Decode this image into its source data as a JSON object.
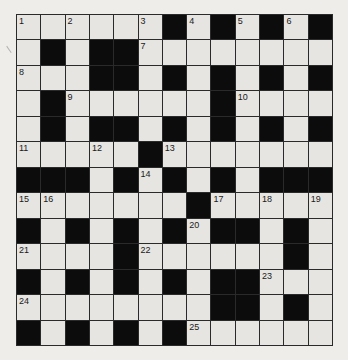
{
  "puzzle": {
    "rows": 13,
    "cols": 13,
    "layout": [
      "WWWWWWBWBWBWB",
      "WBWBBWWWWWWWW",
      "WWWBBWBWBWBWB",
      "WBWWWWWWBWWWW",
      "WBWBBWBWBWBWB",
      "WWWWWBWWWWWWW",
      "BBBWBWBWBWBBB",
      "WWWWWWWBWWWWW",
      "BWBWBWBWBBWBW",
      "WWWWBWWWWWWBW",
      "BWBWBWBWBBWWW",
      "WWWWWWWWBBWBW",
      "BWBWBWBWWWWWW"
    ],
    "numbers": [
      {
        "n": "1",
        "r": 0,
        "c": 0
      },
      {
        "n": "2",
        "r": 0,
        "c": 2
      },
      {
        "n": "3",
        "r": 0,
        "c": 5
      },
      {
        "n": "4",
        "r": 0,
        "c": 7
      },
      {
        "n": "5",
        "r": 0,
        "c": 9
      },
      {
        "n": "6",
        "r": 0,
        "c": 11
      },
      {
        "n": "7",
        "r": 1,
        "c": 5
      },
      {
        "n": "8",
        "r": 2,
        "c": 0
      },
      {
        "n": "9",
        "r": 3,
        "c": 2
      },
      {
        "n": "10",
        "r": 3,
        "c": 9
      },
      {
        "n": "11",
        "r": 5,
        "c": 0
      },
      {
        "n": "12",
        "r": 5,
        "c": 3
      },
      {
        "n": "13",
        "r": 5,
        "c": 6
      },
      {
        "n": "14",
        "r": 6,
        "c": 5
      },
      {
        "n": "15",
        "r": 7,
        "c": 0
      },
      {
        "n": "16",
        "r": 7,
        "c": 1
      },
      {
        "n": "17",
        "r": 7,
        "c": 8
      },
      {
        "n": "18",
        "r": 7,
        "c": 10
      },
      {
        "n": "19",
        "r": 7,
        "c": 12
      },
      {
        "n": "20",
        "r": 8,
        "c": 7
      },
      {
        "n": "21",
        "r": 9,
        "c": 0
      },
      {
        "n": "22",
        "r": 9,
        "c": 5
      },
      {
        "n": "23",
        "r": 10,
        "c": 10
      },
      {
        "n": "24",
        "r": 11,
        "c": 0
      },
      {
        "n": "25",
        "r": 12,
        "c": 7
      }
    ],
    "colors": {
      "white_cell": "#e6e5e2",
      "black_cell": "#0c0c0c",
      "grid_line": "#2a2a2a",
      "paper": "#eeedea"
    }
  }
}
